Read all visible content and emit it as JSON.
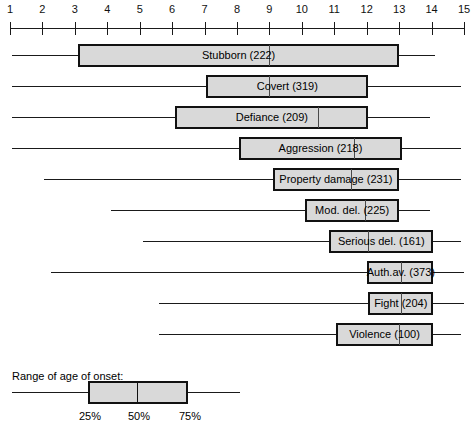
{
  "chart_data": {
    "type": "bar",
    "subtype": "box-and-whisker (horizontal)",
    "title": "",
    "xlabel": "",
    "ylabel": "",
    "xlim": [
      1,
      15
    ],
    "xticks": [
      1,
      2,
      3,
      4,
      5,
      6,
      7,
      8,
      9,
      10,
      11,
      12,
      13,
      14,
      15
    ],
    "xticklabels": [
      "1",
      "2",
      "3",
      "4",
      "5",
      "6",
      "7",
      "8",
      "9",
      "10",
      "11",
      "12",
      "13",
      "14",
      "15"
    ],
    "grid": false,
    "legend_position": "bottom-left",
    "categories": [
      "Stubborn (222)",
      "Covert (319)",
      "Defiance (209)",
      "Aggression (218)",
      "Property damage (231)",
      "Mod. del. (225)",
      "Serious del. (161)",
      "Auth.av. (373)",
      "Fight (204)",
      "Violence (100)"
    ],
    "rows": [
      {
        "label": "Stubborn (222)",
        "n": 222,
        "min": 1.05,
        "q1": 3.1,
        "median": 9.0,
        "q3": 13.0,
        "max": 14.1
      },
      {
        "label": "Covert (319)",
        "n": 319,
        "min": 1.05,
        "q1": 7.05,
        "median": 9.0,
        "q3": 12.05,
        "max": 14.9
      },
      {
        "label": "Defiance (209)",
        "n": 209,
        "min": 1.05,
        "q1": 6.1,
        "median": 10.5,
        "q3": 12.05,
        "max": 13.95
      },
      {
        "label": "Aggression (218)",
        "n": 218,
        "min": 1.05,
        "q1": 8.05,
        "median": 11.6,
        "q3": 13.1,
        "max": 14.9
      },
      {
        "label": "Property damage (231)",
        "n": 231,
        "min": 2.05,
        "q1": 9.1,
        "median": 11.5,
        "q3": 13.0,
        "max": 14.9
      },
      {
        "label": "Mod. del. (225)",
        "n": 225,
        "min": 4.1,
        "q1": 10.1,
        "median": 11.95,
        "q3": 13.0,
        "max": 13.95
      },
      {
        "label": "Serious del. (161)",
        "n": 161,
        "min": 5.1,
        "q1": 10.85,
        "median": 12.05,
        "q3": 14.05,
        "max": 14.9
      },
      {
        "label": "Auth.av. (373)",
        "n": 373,
        "min": 2.25,
        "q1": 12.0,
        "median": 13.05,
        "q3": 14.05,
        "max": 15.0
      },
      {
        "label": "Fight (204)",
        "n": 204,
        "min": 5.6,
        "q1": 12.05,
        "median": 13.05,
        "q3": 14.05,
        "max": 15.0
      },
      {
        "label": "Violence (100)",
        "n": 100,
        "min": 5.6,
        "q1": 11.05,
        "median": 13.0,
        "q3": 14.05,
        "max": 14.9
      }
    ]
  },
  "axis": {
    "ticks": [
      {
        "value": 1,
        "label": "1"
      },
      {
        "value": 2,
        "label": "2"
      },
      {
        "value": 3,
        "label": "3"
      },
      {
        "value": 4,
        "label": "4"
      },
      {
        "value": 5,
        "label": "5"
      },
      {
        "value": 6,
        "label": "6"
      },
      {
        "value": 7,
        "label": "7"
      },
      {
        "value": 8,
        "label": "8"
      },
      {
        "value": 9,
        "label": "9"
      },
      {
        "value": 10,
        "label": "10"
      },
      {
        "value": 11,
        "label": "11"
      },
      {
        "value": 12,
        "label": "12"
      },
      {
        "value": 13,
        "label": "13"
      },
      {
        "value": 14,
        "label": "14"
      },
      {
        "value": 15,
        "label": "15"
      }
    ]
  },
  "legend": {
    "title": "Range of age of onset:",
    "marks": [
      {
        "label": "25%"
      },
      {
        "label": "50%"
      },
      {
        "label": "75%"
      }
    ]
  },
  "colors": {
    "box_fill": "#d9d9d9",
    "box_stroke": "#111111",
    "line": "#1a1a1a",
    "text": "#000000",
    "background": "#ffffff"
  }
}
